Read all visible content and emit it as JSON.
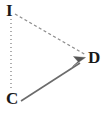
{
  "diagram": {
    "canvas": {
      "width": 109,
      "height": 114,
      "background": "#ffffff"
    },
    "vertices": [
      {
        "id": "I",
        "label": "I",
        "x": 11,
        "y": 16,
        "label_x": 6,
        "label_y": 2
      },
      {
        "id": "C",
        "label": "C",
        "x": 14,
        "y": 98,
        "label_x": 6,
        "label_y": 90
      },
      {
        "id": "D",
        "label": "D",
        "x": 87,
        "y": 58,
        "label_x": 88,
        "label_y": 49
      }
    ],
    "edges": [
      {
        "id": "I-C",
        "from": "I",
        "to": "C",
        "style": "dotted",
        "arrow": false,
        "color": "#9a9a9a",
        "width": 1.6,
        "dash": "1,3",
        "x1": 11,
        "y1": 19,
        "x2": 11,
        "y2": 90
      },
      {
        "id": "I-D",
        "from": "I",
        "to": "D",
        "style": "dashed",
        "arrow": false,
        "color": "#8e8e8e",
        "width": 1.4,
        "dash": "3,2.5",
        "x1": 15,
        "y1": 14,
        "x2": 86,
        "y2": 55
      },
      {
        "id": "C-D",
        "from": "C",
        "to": "D",
        "style": "solid",
        "arrow": true,
        "color": "#6b6b6b",
        "width": 1.6,
        "dash": "none",
        "x1": 21,
        "y1": 101,
        "x2": 82,
        "y2": 62
      }
    ],
    "arrowhead": {
      "id": "arrow-C-D",
      "tip_x": 85,
      "tip_y": 58,
      "color": "#555555",
      "points": "85,58 73,66 78,62 74,57"
    },
    "colors": {
      "stroke_dotted": "#9a9a9a",
      "stroke_dashed": "#8e8e8e",
      "stroke_solid": "#6b6b6b",
      "arrow_fill": "#555555",
      "label_text": "#1a1a1a",
      "background": "#ffffff"
    }
  }
}
